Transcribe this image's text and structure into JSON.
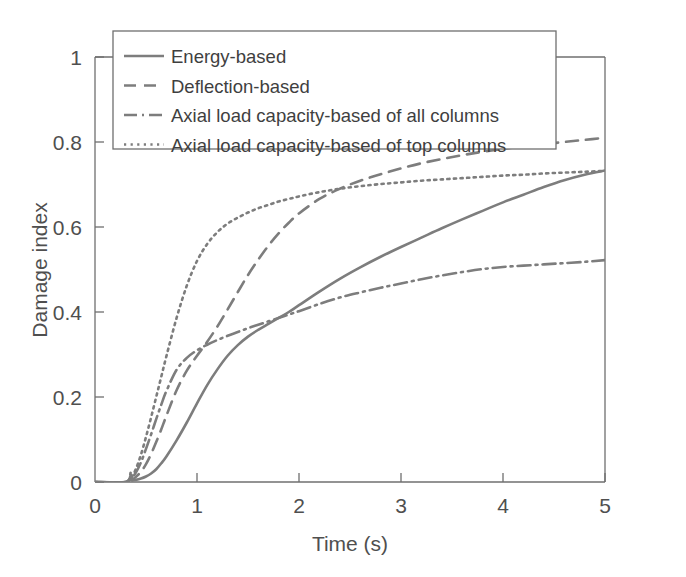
{
  "chart_data": {
    "type": "line",
    "title": "",
    "xlabel": "Time (s)",
    "ylabel": "Damage index",
    "xlim": [
      0,
      5
    ],
    "ylim": [
      0,
      1
    ],
    "xticks": [
      "0",
      "1",
      "2",
      "3",
      "4",
      "5"
    ],
    "yticks": [
      "0",
      "0.2",
      "0.4",
      "0.6",
      "0.8",
      "1"
    ],
    "xtick_values": [
      0,
      1,
      2,
      3,
      4,
      5
    ],
    "ytick_values": [
      0,
      0.2,
      0.4,
      0.6,
      0.8,
      1
    ],
    "grid": false,
    "legend_position": "top-left-inside-above",
    "line_color": "#7d7d7d",
    "axis_color": "#6f6f6f",
    "series": [
      {
        "name": "Energy-based",
        "style": "solid",
        "x": [
          0.0,
          0.3,
          0.35,
          0.36,
          0.4,
          0.45,
          0.5,
          0.55,
          0.6,
          0.65,
          0.7,
          0.8,
          0.9,
          1.0,
          1.1,
          1.2,
          1.3,
          1.4,
          1.5,
          1.6,
          1.7,
          1.8,
          1.9,
          2.0,
          2.2,
          2.4,
          2.6,
          2.8,
          3.0,
          3.2,
          3.4,
          3.6,
          3.8,
          4.0,
          4.2,
          4.4,
          4.6,
          4.8,
          5.0
        ],
        "y": [
          0.0,
          0.0,
          0.01,
          0.004,
          0.005,
          0.008,
          0.013,
          0.02,
          0.03,
          0.044,
          0.06,
          0.098,
          0.14,
          0.185,
          0.228,
          0.265,
          0.297,
          0.322,
          0.342,
          0.358,
          0.372,
          0.386,
          0.4,
          0.416,
          0.448,
          0.478,
          0.505,
          0.53,
          0.553,
          0.575,
          0.597,
          0.618,
          0.638,
          0.658,
          0.676,
          0.694,
          0.71,
          0.723,
          0.733
        ]
      },
      {
        "name": "Deflection-based",
        "style": "dashed",
        "x": [
          0.0,
          0.3,
          0.35,
          0.36,
          0.4,
          0.45,
          0.5,
          0.55,
          0.6,
          0.65,
          0.7,
          0.8,
          0.9,
          1.0,
          1.1,
          1.2,
          1.3,
          1.4,
          1.5,
          1.6,
          1.7,
          1.8,
          1.9,
          2.0,
          2.2,
          2.4,
          2.6,
          2.8,
          3.0,
          3.2,
          3.4,
          3.6,
          3.8,
          4.0,
          4.2,
          4.4,
          4.6,
          4.8,
          5.0
        ],
        "y": [
          0.0,
          0.0,
          0.014,
          0.006,
          0.012,
          0.024,
          0.042,
          0.066,
          0.094,
          0.124,
          0.156,
          0.216,
          0.262,
          0.297,
          0.33,
          0.366,
          0.406,
          0.447,
          0.487,
          0.523,
          0.556,
          0.585,
          0.61,
          0.632,
          0.666,
          0.69,
          0.709,
          0.724,
          0.738,
          0.75,
          0.76,
          0.769,
          0.777,
          0.784,
          0.79,
          0.795,
          0.8,
          0.805,
          0.81
        ]
      },
      {
        "name": "Axial load capacity-based of all columns",
        "style": "dashdot",
        "x": [
          0.0,
          0.3,
          0.35,
          0.36,
          0.4,
          0.45,
          0.5,
          0.55,
          0.6,
          0.65,
          0.7,
          0.8,
          0.9,
          1.0,
          1.1,
          1.2,
          1.3,
          1.4,
          1.5,
          1.6,
          1.7,
          1.8,
          1.9,
          2.0,
          2.2,
          2.4,
          2.6,
          2.8,
          3.0,
          3.2,
          3.4,
          3.6,
          3.8,
          4.0,
          4.2,
          4.4,
          4.6,
          4.8,
          5.0
        ],
        "y": [
          0.0,
          0.0,
          0.02,
          0.01,
          0.022,
          0.046,
          0.078,
          0.112,
          0.148,
          0.182,
          0.214,
          0.264,
          0.292,
          0.31,
          0.323,
          0.334,
          0.344,
          0.353,
          0.362,
          0.37,
          0.378,
          0.386,
          0.394,
          0.402,
          0.419,
          0.434,
          0.446,
          0.457,
          0.467,
          0.477,
          0.486,
          0.494,
          0.501,
          0.506,
          0.509,
          0.512,
          0.515,
          0.518,
          0.522
        ]
      },
      {
        "name": "Axial load capacity-based of top columns",
        "style": "dotted",
        "x": [
          0.0,
          0.3,
          0.35,
          0.36,
          0.4,
          0.45,
          0.5,
          0.55,
          0.6,
          0.65,
          0.7,
          0.8,
          0.9,
          1.0,
          1.1,
          1.2,
          1.3,
          1.4,
          1.5,
          1.6,
          1.7,
          1.8,
          1.9,
          2.0,
          2.2,
          2.4,
          2.6,
          2.8,
          3.0,
          3.2,
          3.4,
          3.6,
          3.8,
          4.0,
          4.2,
          4.4,
          4.6,
          4.8,
          5.0
        ],
        "y": [
          0.0,
          0.0,
          0.022,
          0.012,
          0.03,
          0.064,
          0.106,
          0.152,
          0.2,
          0.248,
          0.296,
          0.386,
          0.462,
          0.52,
          0.56,
          0.588,
          0.608,
          0.622,
          0.634,
          0.644,
          0.652,
          0.66,
          0.666,
          0.672,
          0.682,
          0.69,
          0.696,
          0.701,
          0.705,
          0.709,
          0.712,
          0.715,
          0.718,
          0.721,
          0.723,
          0.726,
          0.728,
          0.73,
          0.732
        ]
      }
    ]
  },
  "legend": {
    "items": [
      {
        "label": "Energy-based",
        "style": "solid"
      },
      {
        "label": "Deflection-based",
        "style": "dashed"
      },
      {
        "label": "Axial load capacity-based of all columns",
        "style": "dashdot"
      },
      {
        "label": "Axial load capacity-based of top columns",
        "style": "dotted"
      }
    ]
  }
}
